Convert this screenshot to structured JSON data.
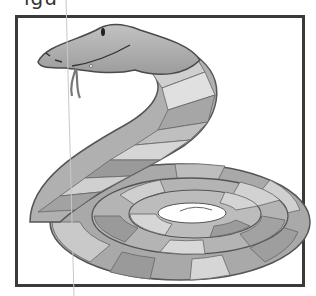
{
  "page": {
    "caption_partial": "igu",
    "illustration": {
      "subject": "coiled-snake",
      "alt": "Cartoon snake coiled in a spiral with striped gray bands"
    }
  },
  "colors": {
    "frame": "#3a3a3a",
    "outline": "#555555",
    "band_dark": "#9a9a9a",
    "band_mid": "#b5b5b5",
    "band_light": "#d8d8d8",
    "head": "#a8a8a8",
    "margin_line": "#c8c8c8"
  }
}
